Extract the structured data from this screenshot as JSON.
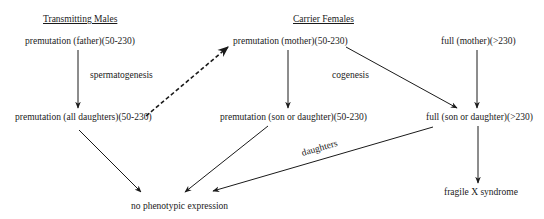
{
  "diagram": {
    "headers": {
      "left": "Transmitting Males",
      "right": "Carrier Females"
    },
    "nodes": {
      "father": "premutation  (father)(50-230)",
      "mother_pre": "premutation  (mother)(50-230)",
      "mother_full": "full  (mother)(>230)",
      "all_daughters": "premutation (all daughters)(50-230)",
      "son_daughter_pre": "premutation  (son or daughter)(50-230)",
      "son_daughter_full": "full  (son or daughter)(>230)",
      "no_phenotype": "no phenotypic expression",
      "fragile_x": "fragile X syndrome"
    },
    "edge_labels": {
      "spermatogenesis": "spermatogenesis",
      "oogenesis": "cogenesis",
      "daughters": "daughters"
    },
    "edges": [
      {
        "from": "father",
        "to": "all_daughters",
        "style": "solid"
      },
      {
        "from": "all_daughters",
        "to": "mother_pre",
        "style": "dashed"
      },
      {
        "from": "mother_pre",
        "to": "son_daughter_pre",
        "style": "solid"
      },
      {
        "from": "mother_pre",
        "to": "son_daughter_full",
        "style": "solid"
      },
      {
        "from": "mother_full",
        "to": "son_daughter_full",
        "style": "solid"
      },
      {
        "from": "all_daughters",
        "to": "no_phenotype",
        "style": "solid"
      },
      {
        "from": "son_daughter_pre",
        "to": "no_phenotype",
        "style": "solid"
      },
      {
        "from": "son_daughter_full",
        "to": "no_phenotype",
        "style": "solid",
        "label": "daughters"
      },
      {
        "from": "son_daughter_full",
        "to": "fragile_x",
        "style": "solid"
      }
    ],
    "colors": {
      "ink": "#1a1a1a",
      "background": "#ffffff"
    }
  }
}
